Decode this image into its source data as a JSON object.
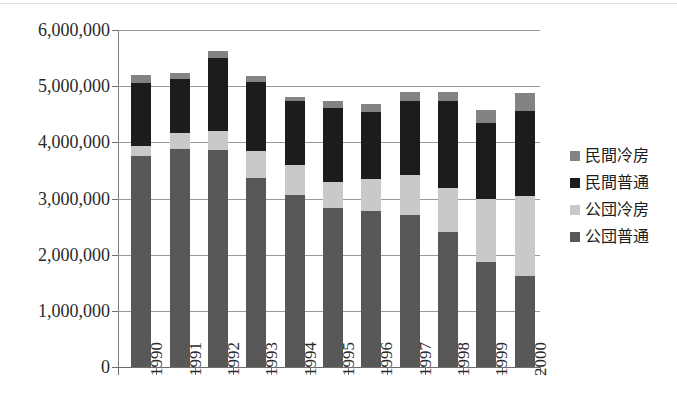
{
  "chart_data": {
    "type": "bar",
    "subtype": "stacked-vertical",
    "title": "",
    "xlabel": "",
    "ylabel": "",
    "categories": [
      "1990",
      "1991",
      "1992",
      "1993",
      "1994",
      "1995",
      "1996",
      "1997",
      "1998",
      "1999",
      "2000"
    ],
    "ylim": [
      0,
      6000000
    ],
    "ytick_values": [
      0,
      1000000,
      2000000,
      3000000,
      4000000,
      5000000,
      6000000
    ],
    "ytick_labels": [
      "0",
      "1,000,000",
      "2,000,000",
      "3,000,000",
      "4,000,000",
      "5,000,000",
      "6,000,000"
    ],
    "grid": true,
    "grid_axis": "y",
    "legend_position": "right",
    "stack_order_bottom_to_top": [
      "公団普通",
      "公団冷房",
      "民間普通",
      "民間冷房"
    ],
    "series": [
      {
        "name": "公団普通",
        "color": "#585858",
        "values": [
          3760000,
          3890000,
          3870000,
          3370000,
          3070000,
          2830000,
          2780000,
          2710000,
          2410000,
          1870000,
          1620000
        ]
      },
      {
        "name": "公団冷房",
        "color": "#c9c9c9",
        "values": [
          180000,
          280000,
          330000,
          470000,
          530000,
          460000,
          560000,
          700000,
          780000,
          1120000,
          1420000
        ]
      },
      {
        "name": "民間普通",
        "color": "#1c1c1c",
        "values": [
          1120000,
          950000,
          1300000,
          1230000,
          1140000,
          1320000,
          1200000,
          1330000,
          1550000,
          1350000,
          1520000
        ]
      },
      {
        "name": "民間冷房",
        "color": "#838383",
        "values": [
          140000,
          120000,
          130000,
          120000,
          60000,
          120000,
          150000,
          160000,
          160000,
          230000,
          320000
        ]
      }
    ],
    "totals": [
      5200000,
      5240000,
      5630000,
      5190000,
      4800000,
      4730000,
      4690000,
      4900000,
      4900000,
      4570000,
      4880000
    ],
    "legend_entries": [
      "民間冷房",
      "民間普通",
      "公団冷房",
      "公団普通"
    ]
  },
  "axis": {
    "y_labels": [
      "6,000,000",
      "5,000,000",
      "4,000,000",
      "3,000,000",
      "2,000,000",
      "1,000,000",
      "0"
    ],
    "x_labels": [
      "1990",
      "1991",
      "1992",
      "1993",
      "1994",
      "1995",
      "1996",
      "1997",
      "1998",
      "1999",
      "2000"
    ]
  },
  "legend": {
    "items": [
      {
        "label": "民間冷房",
        "color": "#838383"
      },
      {
        "label": "民間普通",
        "color": "#1c1c1c"
      },
      {
        "label": "公団冷房",
        "color": "#c9c9c9"
      },
      {
        "label": "公団普通",
        "color": "#585858"
      }
    ]
  },
  "colors": {
    "minkan_reibou": "#838383",
    "minkan_futsu": "#1c1c1c",
    "koudan_reibou": "#c9c9c9",
    "koudan_futsu": "#585858",
    "gridline": "#9a9a9a",
    "axis": "#6e6e6e",
    "background": "#ffffff"
  }
}
